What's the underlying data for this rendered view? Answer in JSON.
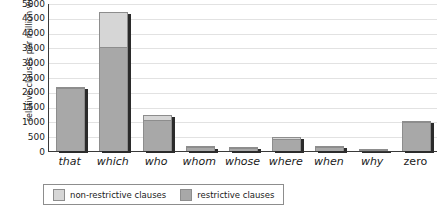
{
  "chart_data": {
    "type": "bar",
    "barmode": "stacked",
    "title": "",
    "subtitle": "",
    "xlabel": "",
    "ylabel": "relative clauses per million words",
    "ylim": [
      0,
      5000
    ],
    "ytick_step": 500,
    "grid": true,
    "legend_position": "bottom-left",
    "categories": [
      "that",
      "which",
      "who",
      "whom",
      "whose",
      "where",
      "when",
      "why",
      "zero"
    ],
    "y_tick_labels": [
      "5000",
      "4500",
      "4000",
      "3500",
      "3000",
      "2500",
      "2000",
      "1500",
      "1000",
      "500",
      "0"
    ],
    "series": [
      {
        "name": "restrictive clauses",
        "color": "#a8a8a8",
        "values": [
          2140,
          3530,
          1060,
          130,
          110,
          420,
          150,
          30,
          980
        ]
      },
      {
        "name": "non-restrictive clauses",
        "color": "#d6d6d6",
        "values": [
          30,
          1180,
          150,
          20,
          40,
          60,
          30,
          10,
          40
        ]
      }
    ],
    "totals": [
      2170,
      4710,
      1210,
      150,
      150,
      480,
      180,
      40,
      1020
    ]
  },
  "legend": {
    "items": [
      {
        "label": "non-restrictive clauses",
        "color": "#d6d6d6"
      },
      {
        "label": "restrictive clauses",
        "color": "#a8a8a8"
      }
    ]
  },
  "axes": {
    "y_title": "relative clauses per million words"
  }
}
